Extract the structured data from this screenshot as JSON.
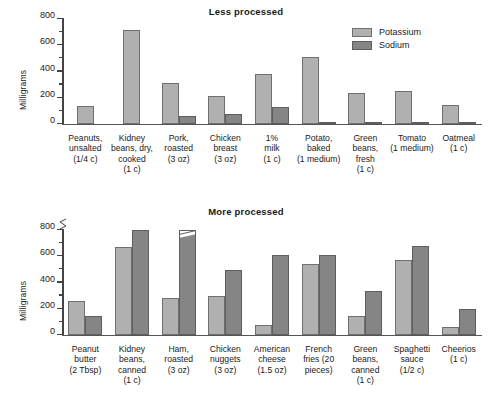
{
  "legend": {
    "position": "top-right",
    "entries": [
      {
        "label": "Potassium",
        "color": "#b0b0b0",
        "icon": "legend-swatch"
      },
      {
        "label": "Sodium",
        "color": "#858585",
        "icon": "legend-swatch"
      }
    ]
  },
  "panels": [
    {
      "id": "less-processed",
      "title": "Less processed",
      "ylabel": "Milligrams",
      "yticks": [
        "0",
        "200",
        "400",
        "600",
        "800"
      ]
    },
    {
      "id": "more-processed",
      "title": "More processed",
      "ylabel": "Milligrams",
      "yticks": [
        "0",
        "200",
        "400",
        "600",
        "800"
      ]
    }
  ],
  "chart_data": [
    {
      "type": "bar",
      "title": "Less processed",
      "xlabel": "",
      "ylabel": "Milligrams",
      "ylim": [
        0,
        800
      ],
      "ytick_major_step": 200,
      "ytick_minor_step": 100,
      "grid": false,
      "axis_break": false,
      "legend_position": "top-right",
      "categories": [
        "Peanuts,\nunsalted\n(1/4 c)",
        "Kidney\nbeans, dry,\ncooked\n(1 c)",
        "Pork,\nroasted\n(3 oz)",
        "Chicken\nbreast\n(3 oz)",
        "1%\nmilk\n(1 c)",
        "Potato,\nbaked\n(1 medium)",
        "Green\nbeans,\nfresh\n(1 c)",
        "Tomato\n(1 medium)",
        "Oatmeal\n(1 c)"
      ],
      "series": [
        {
          "name": "Potassium",
          "color": "#b0b0b0",
          "values": [
            130,
            710,
            310,
            210,
            380,
            510,
            230,
            250,
            140
          ]
        },
        {
          "name": "Sodium",
          "color": "#858585",
          "values": [
            0,
            0,
            60,
            70,
            125,
            15,
            12,
            10,
            5
          ]
        }
      ]
    },
    {
      "type": "bar",
      "title": "More processed",
      "xlabel": "",
      "ylabel": "Milligrams",
      "ylim": [
        0,
        900
      ],
      "ytick_major_step": 200,
      "ytick_minor_step": 100,
      "grid": false,
      "axis_break": true,
      "axis_break_note": "y-axis broken above 800; Ham sodium bar truncated",
      "legend_position": "top-right",
      "categories": [
        "Peanut\nbutter\n(2 Tbsp)",
        "Kidney\nbeans,\ncanned\n(1 c)",
        "Ham,\nroasted\n(3 oz)",
        "Chicken\nnuggets\n(3 oz)",
        "American\ncheese\n(1.5 oz)",
        "French\nfries (20\npieces)",
        "Green\nbeans,\ncanned\n(1 c)",
        "Spaghetti\nsauce\n(1/2 c)",
        "Cheerios\n(1 c)"
      ],
      "series": [
        {
          "name": "Potassium",
          "color": "#b0b0b0",
          "values": [
            255,
            670,
            275,
            290,
            75,
            535,
            140,
            565,
            55
          ]
        },
        {
          "name": "Sodium",
          "color": "#858585",
          "values": [
            140,
            870,
            1020,
            495,
            605,
            605,
            330,
            675,
            195
          ],
          "truncated_index": 2
        }
      ]
    }
  ]
}
